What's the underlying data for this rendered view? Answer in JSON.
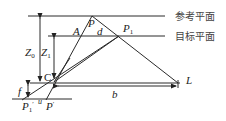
{
  "planes": {
    "reference": "参考平面",
    "target": "目标平面"
  },
  "labels": {
    "P": "P",
    "A": "A",
    "d": "d",
    "P1": "P",
    "P1_sub": "1",
    "Z0": "Z",
    "Z0_sub": "0",
    "Z1": "Z",
    "Z1_sub": "1",
    "C": "C",
    "f": "f",
    "b": "b",
    "L": "L",
    "P1prime": "P",
    "P1prime_sub": "1",
    "P1prime_mark": "′",
    "u": "u",
    "Pprime": "P",
    "Pprime_mark": "′"
  }
}
